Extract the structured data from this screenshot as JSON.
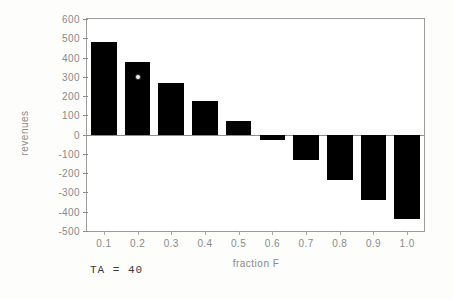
{
  "chart_data": {
    "type": "bar",
    "title": "",
    "xlabel": "fraction F",
    "ylabel": "revenues",
    "categories": [
      "0.1",
      "0.2",
      "0.3",
      "0.4",
      "0.5",
      "0.6",
      "0.7",
      "0.8",
      "0.9",
      "1.0"
    ],
    "values": [
      480,
      378,
      270,
      172,
      70,
      -28,
      -133,
      -237,
      -340,
      -437
    ],
    "ylim": [
      -500,
      600
    ],
    "ytick_labels": [
      "600",
      "500",
      "400",
      "300",
      "200",
      "100",
      "0",
      "-100",
      "-200",
      "-300",
      "-400",
      "-500"
    ],
    "ytick_values": [
      600,
      500,
      400,
      300,
      200,
      100,
      0,
      -100,
      -200,
      -300,
      -400,
      -500
    ],
    "grid": false,
    "legend": null,
    "bar_color": "#000000",
    "axis_color": "#8d8d8d",
    "label_color": "#8a8a8a",
    "background": "#ffffff",
    "annotation": "TA  =  40"
  }
}
